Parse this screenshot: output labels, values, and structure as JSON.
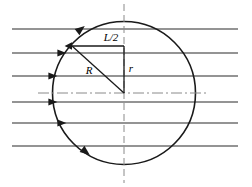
{
  "figure": {
    "background_color": "#ffffff",
    "line_color": "#1a1a1a",
    "flow_line_color": "#2b2b2b",
    "axis_color": "#8a8a8a",
    "width": 252,
    "height": 187
  },
  "labels": {
    "half_length": "L/2",
    "radius_big": "R",
    "radius_small": "r"
  },
  "geometry": {
    "circle": {
      "cx": 124,
      "cy": 93,
      "r": 71.5
    },
    "vertical_axis": {
      "x": 124,
      "y1": 4,
      "y2": 183
    },
    "center_axis": {
      "y": 93,
      "x1": 38,
      "x2": 207
    },
    "chord": {
      "x1": 72,
      "x2": 124,
      "y": 46
    },
    "vertical_drop": {
      "x": 124,
      "y1": 46,
      "y2": 93
    },
    "diagonal": {
      "x1": 72,
      "y1": 46,
      "x2": 124,
      "y2": 93
    }
  },
  "flow_lines": [
    {
      "y": 29,
      "x1": 12,
      "x2": 238,
      "arrow": false,
      "arrow_x": 0
    },
    {
      "y": 53,
      "x1": 12,
      "x2": 238,
      "arrow": true,
      "arrow_x": 62
    },
    {
      "y": 76,
      "x1": 12,
      "x2": 238,
      "arrow": true,
      "arrow_x": 53
    },
    {
      "y": 102,
      "x1": 12,
      "x2": 238,
      "arrow": true,
      "arrow_x": 53
    },
    {
      "y": 123,
      "x1": 12,
      "x2": 238,
      "arrow": true,
      "arrow_x": 62
    },
    {
      "y": 146,
      "x1": 12,
      "x2": 238,
      "arrow": false,
      "arrow_x": 0
    }
  ],
  "circle_arrows": [
    {
      "name": "flow-arrow-top",
      "x": 81,
      "y": 29,
      "angle": -38
    },
    {
      "name": "flow-arrow-bottom",
      "x": 86,
      "y": 152,
      "angle": 38
    }
  ],
  "chord_arrow": {
    "x": 73,
    "y": 46,
    "angle": 180
  }
}
